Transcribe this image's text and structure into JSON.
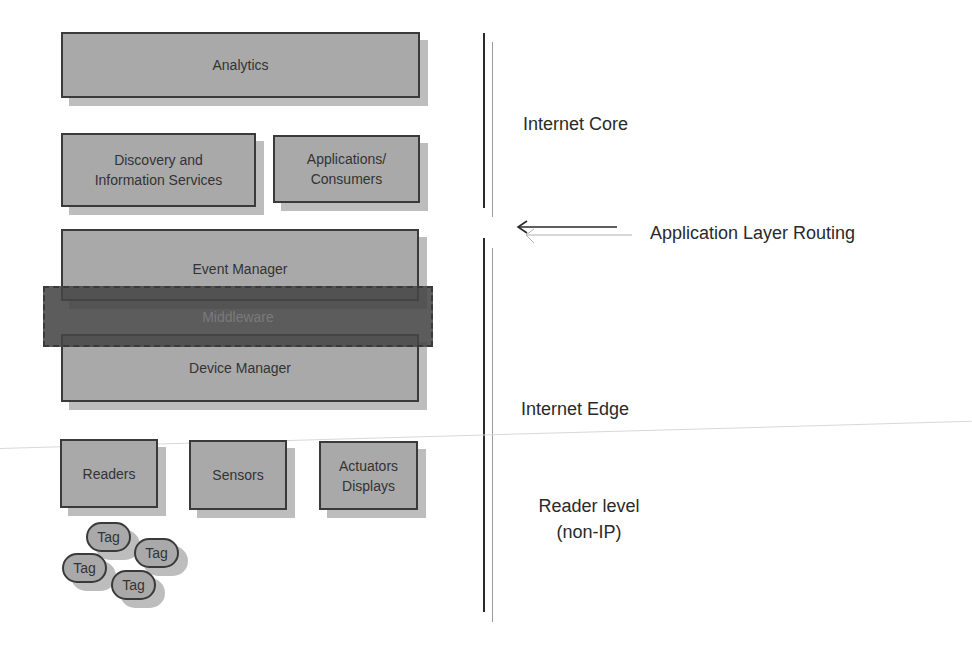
{
  "diagram": {
    "boxes": {
      "analytics": "Analytics",
      "discovery": "Discovery and\nInformation Services",
      "applications": "Applications/\nConsumers",
      "event_manager": "Event Manager",
      "middleware": "Middleware",
      "device_manager": "Device Manager",
      "readers": "Readers",
      "sensors": "Sensors",
      "actuators": "Actuators\nDisplays"
    },
    "tags": [
      "Tag",
      "Tag",
      "Tag",
      "Tag"
    ],
    "layers": {
      "internet_core": "Internet Core",
      "application_routing": "Application Layer Routing",
      "internet_edge": "Internet Edge",
      "reader_level": "Reader level\n(non-IP)"
    },
    "colors": {
      "box_fill": "#a9a9a9",
      "box_border": "#3a3a3a",
      "shadow": "#bdbdbd",
      "middleware_fill": "#4a4a4a",
      "text": "#2a2a2a"
    }
  }
}
